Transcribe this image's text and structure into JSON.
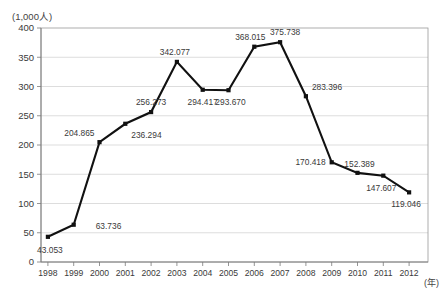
{
  "chart_data": {
    "type": "line",
    "title": "",
    "subtitle": "",
    "ylabel": "(1,000人)",
    "xlabel": "(年)",
    "ylim": [
      0,
      400
    ],
    "ytick_labels": [
      "400",
      "350",
      "300",
      "250",
      "200",
      "150",
      "100",
      "50",
      "0"
    ],
    "ytick_values": [
      400,
      350,
      300,
      250,
      200,
      150,
      100,
      50,
      0
    ],
    "grid": true,
    "legend": "none",
    "categories": [
      "1998",
      "1999",
      "2000",
      "2001",
      "2002",
      "2003",
      "2004",
      "2005",
      "2006",
      "2007",
      "2008",
      "2009",
      "2010",
      "2011",
      "2012"
    ],
    "x": [
      1998,
      1999,
      2000,
      2001,
      2002,
      2003,
      2004,
      2005,
      2006,
      2007,
      2008,
      2009,
      2010,
      2011,
      2012
    ],
    "values": [
      43.053,
      63.736,
      204.865,
      236.294,
      256.273,
      342.077,
      294.417,
      293.67,
      368.015,
      375.738,
      283.396,
      170.418,
      152.389,
      147.607,
      119.046
    ],
    "point_labels": [
      "43.053",
      "63.736",
      "204.865",
      "236.294",
      "256.273",
      "342.077",
      "294.417",
      "293.670",
      "368.015",
      "375.738",
      "283.396",
      "170.418",
      "152.389",
      "147.607",
      "119.046"
    ],
    "series_color": "#111111",
    "grid_color": "#cfcfcf",
    "frame_color": "#9a9a9a",
    "marker": "square"
  }
}
